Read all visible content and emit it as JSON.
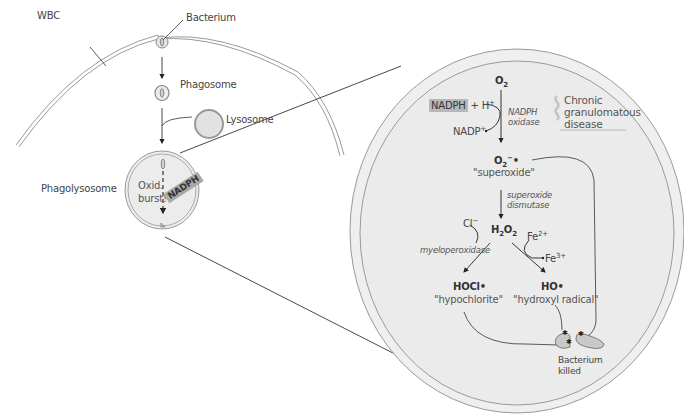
{
  "left_panel": {
    "wbc_label": "WBC",
    "bacterium_label": "Bacterium",
    "phagosome_label": "Phagosome",
    "lysosome_label": "Lysosome",
    "phagolysosome_label": "Phagolysosome",
    "oxid_burst_line1": "Oxid.",
    "oxid_burst_line2": "burst!",
    "nadph_tag": "NADPH"
  },
  "zoom_panel": {
    "o2": "O",
    "o2_sub": "2",
    "nadph": "NADPH",
    "h_plus": "+ H",
    "h_plus_sup": "+",
    "nadp": "NADP",
    "nadp_sup": "+",
    "enzyme_1_line1": "NADPH",
    "enzyme_1_line2": "oxidase",
    "superoxide_formula": "O",
    "superoxide_sub": "2",
    "superoxide_sup": "−",
    "superoxide_dot": "•",
    "superoxide_name": "\"superoxide\"",
    "enzyme_2_line1": "superoxide",
    "enzyme_2_line2": "dismutase",
    "h2o2_h": "H",
    "h2o2_sub1": "2",
    "h2o2_o": "O",
    "h2o2_sub2": "2",
    "chloride": "Cl",
    "chloride_sup": "−",
    "enzyme_3": "myeloperoxidase",
    "fe2": "Fe",
    "fe2_sup": "2+",
    "fe3": "Fe",
    "fe3_sup": "3+",
    "hocl_formula": "HOCl•",
    "hocl_name": "\"hypochlorite\"",
    "ho_formula": "HO•",
    "ho_name": "\"hydroxyl radical\"",
    "killed_line1": "Bacterium",
    "killed_line2": "killed",
    "cgd_line1": "Chronic",
    "cgd_line2": "granulomatous",
    "cgd_line3": "disease"
  },
  "colors": {
    "membrane": "#9a9a9a",
    "cytoplasm": "#ececec",
    "highlight": "#b8b8b8",
    "line": "#333333"
  }
}
